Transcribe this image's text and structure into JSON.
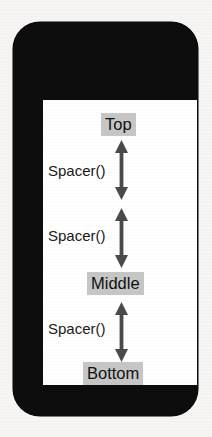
{
  "canvas": {
    "background_color": "#f6f5f3",
    "width": 212,
    "height": 437
  },
  "device": {
    "name": "smartphone-mockup",
    "frame_color": "#0d0d0d",
    "screen_color": "#ffffff"
  },
  "screen": {
    "labels": [
      {
        "id": "top",
        "text": "Top",
        "highlight_color": "#c6c6c6",
        "text_color": "#111111"
      },
      {
        "id": "middle",
        "text": "Middle",
        "highlight_color": "#c6c6c6",
        "text_color": "#111111"
      },
      {
        "id": "bottom",
        "text": "Bottom",
        "highlight_color": "#c6c6c6",
        "text_color": "#111111"
      }
    ],
    "spacers": [
      {
        "id": "spacer-1",
        "text": "Spacer()"
      },
      {
        "id": "spacer-2",
        "text": "Spacer()"
      },
      {
        "id": "spacer-3",
        "text": "Spacer()"
      }
    ],
    "arrows": {
      "color": "#4a4a4a",
      "count": 3,
      "style": "double-headed-vertical"
    }
  }
}
